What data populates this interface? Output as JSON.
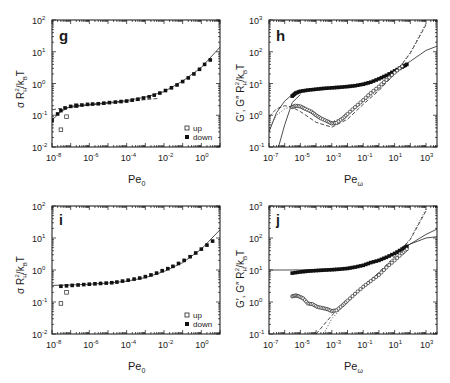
{
  "chart_data": [
    {
      "panel": "g",
      "type": "scatter",
      "title": "",
      "xlabel": "Pe",
      "xlabel_sub": "0",
      "ylabel": "σ R_H^2 / k_B T",
      "xscale": "log",
      "yscale": "log",
      "xlim": [
        1e-08,
        10
      ],
      "ylim": [
        0.01,
        100
      ],
      "xticks": [
        -8,
        -6,
        -4,
        -2,
        0
      ],
      "yticks": [
        -2,
        -1,
        0,
        1,
        2
      ],
      "frame": {
        "x": 52,
        "y": 20,
        "w": 168,
        "h": 127
      },
      "legend": {
        "position": "lower right",
        "entries": [
          "up",
          "down"
        ]
      },
      "series": [
        {
          "name": "up",
          "marker": "open-square",
          "x": [
            3e-08,
            6e-08,
            2e-07
          ],
          "y": [
            0.035,
            0.09,
            0.2
          ]
        },
        {
          "name": "down",
          "marker": "filled-square",
          "x": [
            1e-08,
            2e-08,
            3e-08,
            5e-08,
            1e-07,
            2e-07,
            4e-07,
            8e-07,
            1.5e-06,
            3e-06,
            6e-06,
            1.2e-05,
            2.5e-05,
            5e-05,
            0.0001,
            0.0002,
            0.0004,
            0.0008,
            0.0016,
            0.003,
            0.006,
            0.012,
            0.025,
            0.05,
            0.1,
            0.2,
            0.4,
            0.8,
            1.5,
            3
          ],
          "y": [
            0.07,
            0.11,
            0.14,
            0.17,
            0.19,
            0.2,
            0.21,
            0.22,
            0.225,
            0.23,
            0.24,
            0.25,
            0.26,
            0.27,
            0.28,
            0.3,
            0.32,
            0.35,
            0.38,
            0.43,
            0.5,
            0.6,
            0.73,
            0.9,
            1.15,
            1.5,
            2.0,
            2.8,
            4.0,
            5.5
          ]
        },
        {
          "name": "fit-solid",
          "line": "solid",
          "x": [
            1e-08,
            3e-08,
            1e-07,
            1e-06,
            1e-05,
            0.0001,
            0.001,
            0.01,
            0.1,
            1,
            10
          ],
          "y": [
            0.07,
            0.13,
            0.19,
            0.22,
            0.25,
            0.29,
            0.37,
            0.55,
            1.2,
            3.2,
            14
          ]
        },
        {
          "name": "fit-dashed",
          "line": "dashed",
          "x": [
            1e-08,
            1e-07,
            1e-06,
            1e-05,
            0.0001,
            0.001,
            0.005
          ],
          "y": [
            0.15,
            0.18,
            0.21,
            0.24,
            0.27,
            0.31,
            0.34
          ]
        }
      ]
    },
    {
      "panel": "h",
      "type": "line",
      "title": "",
      "xlabel": "Pe",
      "xlabel_sub": "ω",
      "ylabel": "G′, G″ R_H^2 / k_B T",
      "xscale": "log",
      "yscale": "log",
      "xlim": [
        1e-07,
        5000
      ],
      "ylim": [
        0.1,
        1000
      ],
      "xticks": [
        -7,
        -5,
        -3,
        -1,
        1,
        3
      ],
      "yticks": [
        -1,
        0,
        1,
        2,
        3
      ],
      "frame": {
        "x": 269,
        "y": 20,
        "w": 168,
        "h": 127
      },
      "series": [
        {
          "name": "G' data",
          "marker": "filled-square",
          "x": [
            3e-06,
            5e-06,
            1e-05,
            3e-05,
            0.0001,
            0.0003,
            0.001,
            0.003,
            0.01,
            0.03,
            0.1,
            0.3,
            1,
            3,
            10,
            30,
            60
          ],
          "y": [
            4,
            5,
            5.7,
            6.2,
            6.6,
            7,
            7.3,
            7.6,
            8,
            8.5,
            9.5,
            11,
            14,
            18,
            25,
            33,
            40
          ]
        },
        {
          "name": "G'' data",
          "marker": "open-circle",
          "x": [
            3e-06,
            5e-06,
            1e-05,
            2e-05,
            5e-05,
            0.0001,
            0.0002,
            0.0005,
            0.001,
            0.002,
            0.005,
            0.01,
            0.03,
            0.1,
            0.3,
            1,
            3,
            10,
            30
          ],
          "y": [
            1.8,
            2.0,
            1.9,
            1.6,
            1.3,
            1.0,
            0.8,
            0.65,
            0.55,
            0.58,
            0.8,
            1.1,
            1.8,
            3.0,
            5.0,
            8,
            13,
            22,
            35
          ]
        },
        {
          "name": "G' fit solid",
          "line": "solid",
          "x": [
            1e-07,
            3e-07,
            1e-06,
            3e-06,
            1e-05,
            0.0001,
            0.001,
            0.01,
            0.1,
            1,
            10,
            100,
            1000,
            5000
          ],
          "y": [
            0.3,
            1.2,
            2.8,
            4.5,
            5.8,
            6.8,
            7.5,
            8.2,
            9.6,
            14,
            25,
            50,
            110,
            150
          ]
        },
        {
          "name": "G'' fit solid",
          "line": "solid",
          "x": [
            4e-07,
            1e-06,
            3e-06,
            1e-05
          ],
          "y": [
            0.1,
            0.5,
            2.5,
            4.5
          ]
        },
        {
          "name": "G'' fit dashed",
          "line": "dashed",
          "x": [
            1e-07,
            3e-07,
            1e-06,
            3e-06,
            1e-05,
            0.0001,
            0.001,
            0.01,
            0.1,
            1,
            10,
            100,
            1000
          ],
          "y": [
            0.9,
            1.6,
            2.0,
            1.8,
            1.3,
            0.6,
            0.42,
            0.75,
            2.2,
            6,
            20,
            90,
            700
          ]
        },
        {
          "name": "G'' fit dotted",
          "line": "dotted",
          "x": [
            1e-07,
            3e-07,
            1e-06,
            3e-06,
            1e-05,
            0.0001,
            0.001,
            0.01,
            0.1,
            1,
            10,
            100,
            1000
          ],
          "y": [
            0.4,
            1.0,
            1.6,
            1.9,
            1.7,
            1.0,
            0.62,
            1.0,
            2.6,
            6.5,
            20,
            95,
            800
          ]
        }
      ]
    },
    {
      "panel": "i",
      "type": "scatter",
      "title": "",
      "xlabel": "Pe",
      "xlabel_sub": "0",
      "ylabel": "σ R_H^2 / k_B T",
      "xscale": "log",
      "yscale": "log",
      "xlim": [
        1e-08,
        10
      ],
      "ylim": [
        0.01,
        100
      ],
      "xticks": [
        -8,
        -6,
        -4,
        -2,
        0
      ],
      "yticks": [
        -2,
        -1,
        0,
        1,
        2
      ],
      "frame": {
        "x": 52,
        "y": 206,
        "w": 168,
        "h": 128
      },
      "legend": {
        "position": "lower right",
        "entries": [
          "up",
          "down"
        ]
      },
      "series": [
        {
          "name": "up",
          "marker": "open-square",
          "x": [
            3e-08,
            6e-08
          ],
          "y": [
            0.09,
            0.2
          ]
        },
        {
          "name": "down",
          "marker": "filled-square",
          "x": [
            3e-08,
            6e-08,
            1.2e-07,
            2.5e-07,
            5e-07,
            1e-06,
            2e-06,
            4e-06,
            8e-06,
            1.6e-05,
            3e-05,
            6e-05,
            0.00012,
            0.00025,
            0.0005,
            0.001,
            0.002,
            0.004,
            0.008,
            0.016,
            0.03,
            0.06,
            0.12,
            0.25,
            0.5,
            1,
            2,
            4
          ],
          "y": [
            0.31,
            0.32,
            0.33,
            0.34,
            0.35,
            0.36,
            0.37,
            0.38,
            0.39,
            0.4,
            0.42,
            0.45,
            0.48,
            0.52,
            0.56,
            0.62,
            0.7,
            0.8,
            0.95,
            1.1,
            1.3,
            1.6,
            2.0,
            2.6,
            3.4,
            4.5,
            6,
            8
          ]
        },
        {
          "name": "fit-solid",
          "line": "solid",
          "x": [
            1e-08,
            1e-07,
            1e-06,
            1e-05,
            0.0001,
            0.001,
            0.01,
            0.1,
            1,
            10
          ],
          "y": [
            0.33,
            0.34,
            0.36,
            0.39,
            0.45,
            0.58,
            0.9,
            1.7,
            4.5,
            18
          ]
        }
      ]
    },
    {
      "panel": "j",
      "type": "line",
      "title": "",
      "xlabel": "Pe",
      "xlabel_sub": "ω",
      "ylabel": "G′, G″ R_H^2 / k_B T",
      "xscale": "log",
      "yscale": "log",
      "xlim": [
        1e-07,
        5000
      ],
      "ylim": [
        0.1,
        1000
      ],
      "xticks": [
        -7,
        -5,
        -3,
        -1,
        1,
        3
      ],
      "yticks": [
        -1,
        0,
        1,
        2,
        3
      ],
      "frame": {
        "x": 269,
        "y": 206,
        "w": 168,
        "h": 128
      },
      "series": [
        {
          "name": "G' data",
          "marker": "filled-square",
          "x": [
            3e-06,
            1e-05,
            3e-05,
            0.0001,
            0.0003,
            0.001,
            0.003,
            0.01,
            0.03,
            0.1,
            0.3,
            1,
            3,
            10,
            30,
            60
          ],
          "y": [
            8,
            8.7,
            9.2,
            9.6,
            9.9,
            10.2,
            10.6,
            11.2,
            12.3,
            14,
            17,
            20,
            25,
            33,
            45,
            55
          ]
        },
        {
          "name": "G'' data",
          "marker": "open-circle",
          "x": [
            3e-06,
            5e-06,
            8e-06,
            1.5e-05,
            3e-05,
            6e-05,
            0.00012,
            0.00025,
            0.0005,
            0.001,
            0.002,
            0.005,
            0.01,
            0.03,
            0.1,
            0.3,
            1,
            3,
            10,
            30,
            60
          ],
          "y": [
            1.5,
            1.6,
            1.5,
            1.3,
            0.9,
            0.85,
            0.7,
            0.65,
            0.6,
            0.52,
            0.55,
            0.8,
            1.1,
            1.8,
            3,
            4.5,
            7,
            12,
            20,
            33,
            45
          ]
        },
        {
          "name": "G' fit solid",
          "line": "solid",
          "x": [
            1e-07,
            1e-06,
            1e-05,
            0.0001,
            0.001,
            0.01,
            0.1,
            1,
            10,
            100,
            1000,
            5000
          ],
          "y": [
            10,
            10,
            10.1,
            10.3,
            10.7,
            11.5,
            14,
            20,
            33,
            65,
            130,
            190
          ]
        },
        {
          "name": "G' fit solid 2",
          "line": "solid",
          "x": [
            10,
            100,
            1000,
            5000
          ],
          "y": [
            33,
            65,
            100,
            110
          ]
        },
        {
          "name": "G'' fit dashed",
          "line": "dashed",
          "x": [
            0.0001,
            0.001,
            0.01,
            0.1,
            1,
            10,
            100,
            1000
          ],
          "y": [
            0.1,
            0.38,
            1.1,
            3,
            8.5,
            26,
            90,
            700
          ]
        },
        {
          "name": "G'' fit dotted",
          "line": "dotted",
          "x": [
            0.0003,
            0.001,
            0.01,
            0.1,
            1,
            10,
            100,
            1000
          ],
          "y": [
            0.1,
            0.3,
            1.0,
            2.8,
            8,
            25,
            95,
            800
          ]
        }
      ]
    }
  ],
  "panels": {
    "g": {
      "label": "g",
      "xlabel": "Pe",
      "xsub": "0",
      "legend_up": "up",
      "legend_down": "down",
      "xtick_labels": [
        "10",
        "10",
        "10",
        "10",
        "10"
      ],
      "xtick_exps": [
        "-8",
        "-6",
        "-4",
        "-2",
        "0"
      ],
      "ytick_labels": [
        "10",
        "10",
        "10",
        "10",
        "10"
      ],
      "ytick_exps": [
        "-2",
        "-1",
        "0",
        "1",
        "2"
      ]
    },
    "h": {
      "label": "h",
      "xlabel": "Pe",
      "xsub": "ω",
      "xtick_labels": [
        "10",
        "10",
        "10",
        "10",
        "10",
        "10"
      ],
      "xtick_exps": [
        "-7",
        "-5",
        "-3",
        "-1",
        "1",
        "3"
      ],
      "ytick_labels": [
        "10",
        "10",
        "10",
        "10",
        "10"
      ],
      "ytick_exps": [
        "-1",
        "0",
        "1",
        "2",
        "3"
      ]
    },
    "i": {
      "label": "i",
      "xlabel": "Pe",
      "xsub": "0",
      "legend_up": "up",
      "legend_down": "down"
    },
    "j": {
      "label": "j",
      "xlabel": "Pe",
      "xsub": "ω"
    }
  },
  "ylabels": {
    "sigma_prefix": "σ R",
    "sigma_sub": "H",
    "sigma_sup": "2",
    "sigma_suffix": "/k",
    "sigma_kb_sub": "B",
    "sigma_T": "T",
    "g_prefix": "G′, G″  R",
    "g_sub": "H",
    "g_sup": "2",
    "g_suffix": "/k",
    "g_kb_sub": "B",
    "g_T": "T"
  }
}
